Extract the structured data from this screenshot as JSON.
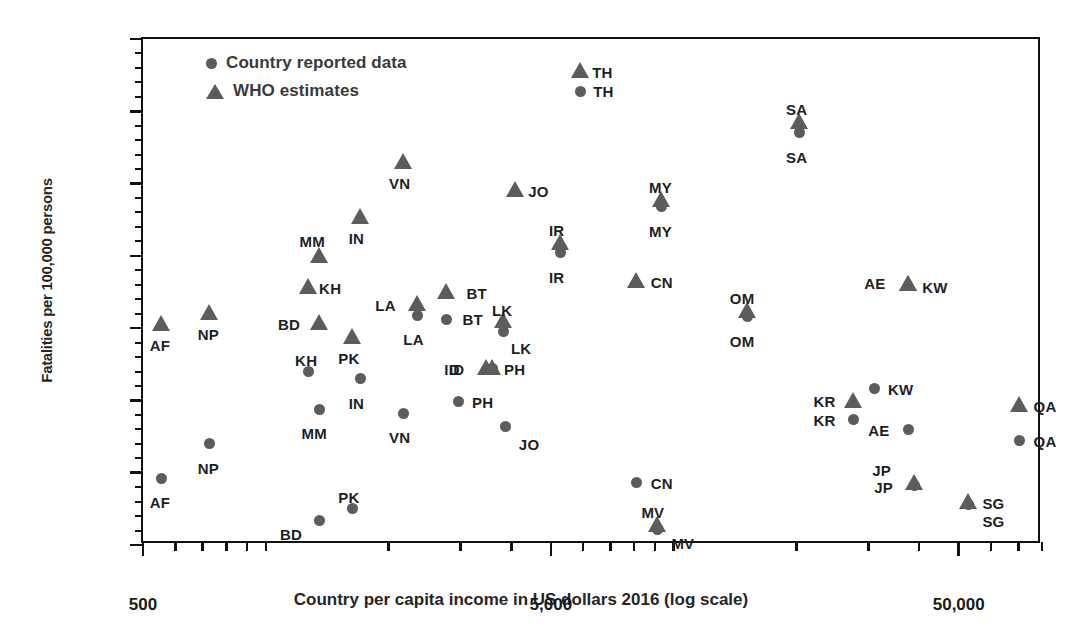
{
  "chart_data": {
    "type": "scatter",
    "title": "",
    "xlabel": "Country per capita income in US dollars 2016 (log scale)",
    "ylabel": "Fatalities per 100,000 persons",
    "xscale": "log",
    "xlim": [
      500,
      80000
    ],
    "ylim": [
      0,
      35
    ],
    "xticks": [
      500,
      5000,
      50000
    ],
    "xticklabels": [
      "500",
      "5,000",
      "50,000"
    ],
    "yticks": [
      0.0,
      5.0,
      10.0,
      15.0,
      20.0,
      25.0,
      30.0,
      35.0
    ],
    "yticklabels": [
      "0.0",
      "5.0",
      "10.0",
      "15.0",
      "20.0",
      "25.0",
      "30.0",
      "35.0"
    ],
    "grid": false,
    "legend_position": "top-left",
    "legend": [
      {
        "key": "reported",
        "marker": "circle",
        "label": "Country reported data"
      },
      {
        "key": "who",
        "marker": "triangle",
        "label": "WHO estimates"
      }
    ],
    "series": [
      {
        "name": "Country reported data",
        "marker": "circle",
        "points": [
          {
            "code": "AF",
            "x": 556,
            "y": 4.6,
            "lx": -12,
            "ly": 16
          },
          {
            "code": "NP",
            "x": 729,
            "y": 7.0,
            "lx": -12,
            "ly": 16
          },
          {
            "code": "BD",
            "x": 1358,
            "y": 1.7,
            "lx": -40,
            "ly": 6
          },
          {
            "code": "KH",
            "x": 1270,
            "y": 12.0,
            "lx": -13,
            "ly": -20
          },
          {
            "code": "MM",
            "x": 1355,
            "y": 9.4,
            "lx": -18,
            "ly": 16
          },
          {
            "code": "PK",
            "x": 1629,
            "y": 2.5,
            "lx": -14,
            "ly": -20
          },
          {
            "code": "IN",
            "x": 1709,
            "y": 11.5,
            "lx": -12,
            "ly": 16
          },
          {
            "code": "VN",
            "x": 2171,
            "y": 9.1,
            "lx": -14,
            "ly": 16
          },
          {
            "code": "LA",
            "x": 2353,
            "y": 15.9,
            "lx": -14,
            "ly": 16
          },
          {
            "code": "BT",
            "x": 2774,
            "y": 15.6,
            "lx": 16,
            "ly": -8
          },
          {
            "code": "ID",
            "x": 3605,
            "y": 12.2,
            "lx": -44,
            "ly": -8
          },
          {
            "code": "LK",
            "x": 3837,
            "y": 14.8,
            "lx": 7,
            "ly": 9
          },
          {
            "code": "PH",
            "x": 2976,
            "y": 9.9,
            "lx": 13,
            "ly": -8
          },
          {
            "code": "JO",
            "x": 3878,
            "y": 8.2,
            "lx": 13,
            "ly": 10
          },
          {
            "code": "TH",
            "x": 5898,
            "y": 31.4,
            "lx": 13,
            "ly": -8
          },
          {
            "code": "IR",
            "x": 5291,
            "y": 20.2,
            "lx": -12,
            "ly": 16
          },
          {
            "code": "MV",
            "x": 9125,
            "y": 1.1,
            "lx": 14,
            "ly": 6
          },
          {
            "code": "CN",
            "x": 8123,
            "y": 4.3,
            "lx": 14,
            "ly": -8
          },
          {
            "code": "MY",
            "x": 9360,
            "y": 23.4,
            "lx": -13,
            "ly": 16
          },
          {
            "code": "OM",
            "x": 15200,
            "y": 15.8,
            "lx": -18,
            "ly": 16
          },
          {
            "code": "SA",
            "x": 20400,
            "y": 28.5,
            "lx": -14,
            "ly": 16
          },
          {
            "code": "KR",
            "x": 27600,
            "y": 8.7,
            "lx": -40,
            "ly": -7
          },
          {
            "code": "JP",
            "x": 38900,
            "y": 4.1,
            "lx": -40,
            "ly": -7
          },
          {
            "code": "AE",
            "x": 37600,
            "y": 8.0,
            "lx": -40,
            "ly": -7
          },
          {
            "code": "KW",
            "x": 31000,
            "y": 10.8,
            "lx": 14,
            "ly": -8
          },
          {
            "code": "SG",
            "x": 52800,
            "y": 2.8,
            "lx": 14,
            "ly": 8
          },
          {
            "code": "QA",
            "x": 70500,
            "y": 7.2,
            "lx": 14,
            "ly": -8
          }
        ]
      },
      {
        "name": "WHO estimates",
        "marker": "triangle",
        "points": [
          {
            "code": "AF",
            "x": 556,
            "y": 15.2,
            "lx": -12,
            "ly": 12
          },
          {
            "code": "NP",
            "x": 729,
            "y": 16.0,
            "lx": -12,
            "ly": 12
          },
          {
            "code": "KH",
            "x": 1270,
            "y": 17.8,
            "lx": 11,
            "ly": -8
          },
          {
            "code": "MM",
            "x": 1355,
            "y": 19.9,
            "lx": -20,
            "ly": -24
          },
          {
            "code": "BD",
            "x": 1358,
            "y": 15.3,
            "lx": -42,
            "ly": -8
          },
          {
            "code": "PK",
            "x": 1629,
            "y": 14.3,
            "lx": -14,
            "ly": 12
          },
          {
            "code": "IN",
            "x": 1709,
            "y": 22.6,
            "lx": -12,
            "ly": 12
          },
          {
            "code": "VN",
            "x": 2171,
            "y": 26.4,
            "lx": -14,
            "ly": 12
          },
          {
            "code": "LA",
            "x": 2353,
            "y": 16.6,
            "lx": -42,
            "ly": -8
          },
          {
            "code": "BT",
            "x": 2774,
            "y": 17.4,
            "lx": 20,
            "ly": -8
          },
          {
            "code": "ID",
            "x": 3474,
            "y": 12.2,
            "lx": -42,
            "ly": -8
          },
          {
            "code": "PH",
            "x": 3605,
            "y": 12.2,
            "lx": 11,
            "ly": -8
          },
          {
            "code": "LK",
            "x": 3837,
            "y": 15.4,
            "lx": -12,
            "ly": -20
          },
          {
            "code": "JO",
            "x": 4090,
            "y": 24.5,
            "lx": 13,
            "ly": -8
          },
          {
            "code": "TH",
            "x": 5898,
            "y": 32.7,
            "lx": 12,
            "ly": -8
          },
          {
            "code": "IR",
            "x": 5291,
            "y": 20.8,
            "lx": -12,
            "ly": -22
          },
          {
            "code": "MV",
            "x": 9125,
            "y": 1.3,
            "lx": -16,
            "ly": -22
          },
          {
            "code": "CN",
            "x": 8123,
            "y": 18.2,
            "lx": 14,
            "ly": -8
          },
          {
            "code": "MY",
            "x": 9360,
            "y": 23.8,
            "lx": -13,
            "ly": -22
          },
          {
            "code": "OM",
            "x": 15200,
            "y": 16.1,
            "lx": -18,
            "ly": -22
          },
          {
            "code": "SA",
            "x": 20400,
            "y": 29.2,
            "lx": -14,
            "ly": -22
          },
          {
            "code": "KR",
            "x": 27600,
            "y": 9.9,
            "lx": -40,
            "ly": -9
          },
          {
            "code": "JP",
            "x": 38900,
            "y": 4.2,
            "lx": -42,
            "ly": -22
          },
          {
            "code": "AE",
            "x": 37600,
            "y": 18.0,
            "lx": -44,
            "ly": -10
          },
          {
            "code": "KW",
            "x": 37600,
            "y": 18.0,
            "lx": 14,
            "ly": -6
          },
          {
            "code": "SG",
            "x": 52800,
            "y": 2.9,
            "lx": 14,
            "ly": -8
          },
          {
            "code": "QA",
            "x": 70500,
            "y": 9.6,
            "lx": 14,
            "ly": -8
          }
        ]
      }
    ]
  }
}
